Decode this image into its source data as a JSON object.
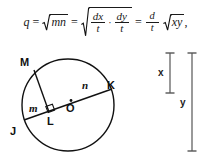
{
  "formula": {
    "lhs_variable": "q",
    "equals": "=",
    "cdot": "·",
    "comma": ",",
    "term1_radicand": "mn",
    "term2": {
      "frac1_num": "dx",
      "frac1_den": "t",
      "frac2_num": "dy",
      "frac2_den": "t"
    },
    "term3": {
      "coef_num": "d",
      "coef_den": "t",
      "radicand": "xy"
    },
    "plain_text": "q = √(mn) = √((dx/t)·(dy/t)) = (d/t)√(xy),"
  },
  "diagram": {
    "points": {
      "M": "M",
      "K": "K",
      "L": "L",
      "O": "O",
      "J": "J"
    },
    "segments": {
      "m": "m",
      "n": "n"
    },
    "right_angle_marker": "right-angle"
  },
  "measures": {
    "x_label": "x",
    "y_label": "y"
  },
  "colors": {
    "ink": "#111111",
    "bar": "#555555",
    "background": "#ffffff"
  }
}
